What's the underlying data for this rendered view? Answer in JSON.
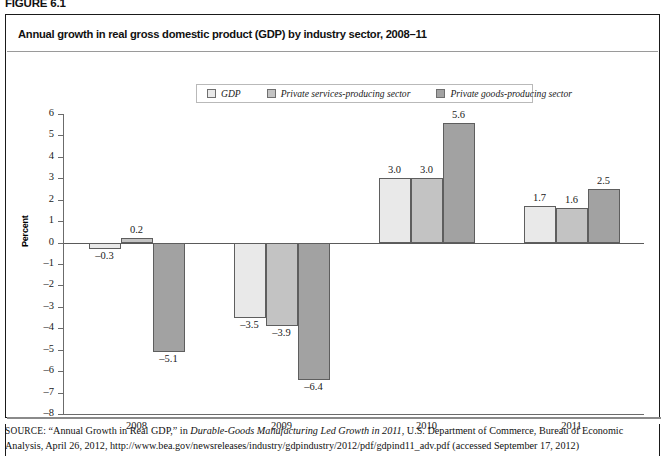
{
  "figure": {
    "label": "FIGURE 6.1",
    "title": "Annual growth in real gross domestic product (GDP) by industry sector, 2008–11"
  },
  "legend": {
    "items": [
      {
        "label": "GDP",
        "color": "#e9e9e9",
        "name": "legend-item-gdp"
      },
      {
        "label": "Private services-producing sector",
        "color": "#c3c3c3",
        "name": "legend-item-private-services"
      },
      {
        "label": "Private goods-producing sector",
        "color": "#a2a2a2",
        "name": "legend-item-private-goods"
      }
    ]
  },
  "axes": {
    "ylabel": "Percent",
    "yticks": [
      "6",
      "5",
      "4",
      "3",
      "2",
      "1",
      "0",
      "–1",
      "–2",
      "–3",
      "–4",
      "–5",
      "–6",
      "–7",
      "–8"
    ],
    "xticks": [
      "2008",
      "2009",
      "2010",
      "2011"
    ]
  },
  "bar_labels": {
    "g0": [
      "–0.3",
      "0.2",
      "–5.1"
    ],
    "g1": [
      "–3.5",
      "–3.9",
      "–6.4"
    ],
    "g2": [
      "3.0",
      "3.0",
      "5.6"
    ],
    "g3": [
      "1.7",
      "1.6",
      "2.5"
    ]
  },
  "source": {
    "prefix": "SOURCE:",
    "part1": " “Annual Growth in Real GDP,” in ",
    "italic1": "Durable-Goods Manufacturing Led Growth in 2011",
    "part2": ", U.S. Department of Commerce, Bureau of Economic Analysis, April 26, 2012, http://www.bea.gov/newsreleases/industry/gdpindustry/2012/pdf/gdpind11_adv.pdf (accessed September 17, 2012)"
  },
  "chart_data": {
    "type": "bar",
    "title": "Annual growth in real gross domestic product (GDP) by industry sector, 2008–11",
    "xlabel": "",
    "ylabel": "Percent",
    "ylim": [
      -8,
      6
    ],
    "ytick_step": 1,
    "grid": false,
    "legend_position": "top-center",
    "categories": [
      "2008",
      "2009",
      "2010",
      "2011"
    ],
    "series": [
      {
        "name": "GDP",
        "color": "#e9e9e9",
        "values": [
          -0.3,
          -3.5,
          3.0,
          1.7
        ]
      },
      {
        "name": "Private services-producing sector",
        "color": "#c3c3c3",
        "values": [
          0.2,
          -3.9,
          3.0,
          1.6
        ]
      },
      {
        "name": "Private goods-producing sector",
        "color": "#a2a2a2",
        "values": [
          -5.1,
          -6.4,
          5.6,
          2.5
        ]
      }
    ]
  }
}
